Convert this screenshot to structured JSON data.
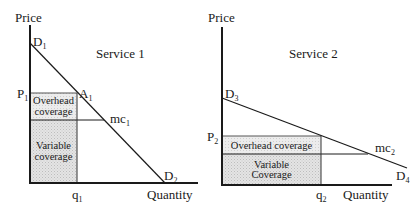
{
  "panels": [
    {
      "title": "Service 1",
      "y_axis_label": "Price",
      "x_axis_label": "Quantity",
      "demand_top_label": "D",
      "demand_top_sub": "1",
      "demand_bottom_label": "D",
      "demand_bottom_sub": "2",
      "price_label": "P",
      "price_sub": "1",
      "point_label": "A",
      "point_sub": "1",
      "mc_label": "mc",
      "mc_sub": "1",
      "quantity_label": "q",
      "quantity_sub": "1",
      "overhead_label_line1": "Overhead",
      "overhead_label_line2": "coverage",
      "variable_label_line1": "Variable",
      "variable_label_line2": "coverage"
    },
    {
      "title": "Service 2",
      "y_axis_label": "Price",
      "x_axis_label": "Quantity",
      "demand_top_label": "D",
      "demand_top_sub": "3",
      "demand_bottom_label": "D",
      "demand_bottom_sub": "4",
      "price_label": "P",
      "price_sub": "2",
      "mc_label": "mc",
      "mc_sub": "2",
      "quantity_label": "q",
      "quantity_sub": "2",
      "overhead_label": "Overhead coverage",
      "variable_label_line1": "Variable",
      "variable_label_line2": "Coverage"
    }
  ],
  "colors": {
    "line": "#1a1a1a",
    "variable_fill": "#d9d9d9",
    "overhead_fill": "#e6e6e6"
  }
}
